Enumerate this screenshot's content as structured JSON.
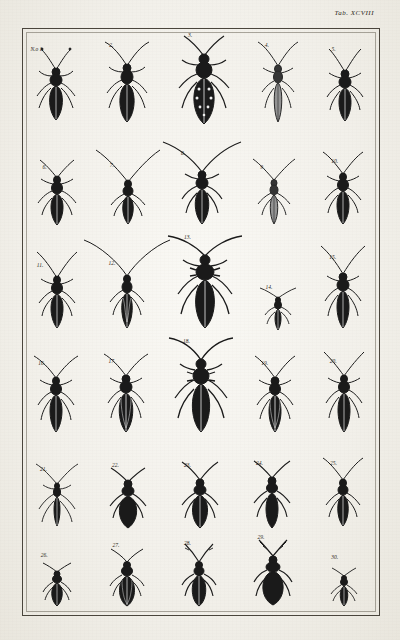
{
  "plate": {
    "tab_label": "Tab. XCVIII",
    "title": "Engraved entomological plate of longhorn beetles (Cerambycidae)",
    "paper_color": "#f3f1ec",
    "ink_color": "#1d1a16",
    "frame_color": "#4a453c"
  },
  "rows": [
    {
      "row_label": "row-1",
      "figures": [
        {
          "number": "N.o 1.",
          "name": "beetle-figure-1",
          "body": "slender",
          "length": 46,
          "antenna": "short-beaded",
          "shade": "dark"
        },
        {
          "number": "2.",
          "name": "beetle-figure-2",
          "body": "slender",
          "length": 48,
          "antenna": "long-curved",
          "shade": "dark"
        },
        {
          "number": "3.",
          "name": "beetle-figure-3",
          "body": "broad-spotted",
          "length": 62,
          "antenna": "very-long-curved",
          "shade": "spotted"
        },
        {
          "number": "4.",
          "name": "beetle-figure-4",
          "body": "narrow-pale",
          "length": 44,
          "antenna": "long-curved",
          "shade": "pale"
        },
        {
          "number": "5.",
          "name": "beetle-figure-5",
          "body": "slender",
          "length": 40,
          "antenna": "short-curved",
          "shade": "dark"
        }
      ]
    },
    {
      "row_label": "row-2",
      "figures": [
        {
          "number": "6.",
          "name": "beetle-figure-6",
          "body": "slender",
          "length": 40,
          "antenna": "medium",
          "shade": "dark"
        },
        {
          "number": "7.",
          "name": "beetle-figure-7",
          "body": "slender",
          "length": 36,
          "antenna": "very-long-sweeping",
          "shade": "dark"
        },
        {
          "number": "8.",
          "name": "beetle-figure-8",
          "body": "slender",
          "length": 44,
          "antenna": "very-long-sweeping",
          "shade": "dark"
        },
        {
          "number": "9.",
          "name": "beetle-figure-9",
          "body": "narrow-pale",
          "length": 36,
          "antenna": "long",
          "shade": "pale"
        },
        {
          "number": "10.",
          "name": "beetle-figure-10",
          "body": "slender",
          "length": 40,
          "antenna": "long-curved",
          "shade": "dark"
        }
      ]
    },
    {
      "row_label": "row-3",
      "figures": [
        {
          "number": "11.",
          "name": "beetle-figure-11",
          "body": "slender",
          "length": 42,
          "antenna": "long-curved",
          "shade": "dark"
        },
        {
          "number": "12.",
          "name": "beetle-figure-12",
          "body": "slender-striped",
          "length": 44,
          "antenna": "very-long-sweeping",
          "shade": "dark"
        },
        {
          "number": "13.",
          "name": "beetle-figure-13",
          "body": "large-spined",
          "length": 66,
          "antenna": "very-long-curved",
          "shade": "dark"
        },
        {
          "number": "14.",
          "name": "beetle-figure-14",
          "body": "small-narrow",
          "length": 26,
          "antenna": "short-spread",
          "shade": "dark"
        },
        {
          "number": "15.",
          "name": "beetle-figure-15",
          "body": "slender",
          "length": 44,
          "antenna": "long-curved",
          "shade": "dark"
        }
      ]
    },
    {
      "row_label": "row-4",
      "figures": [
        {
          "number": "16.",
          "name": "beetle-figure-16",
          "body": "slender",
          "length": 42,
          "antenna": "long-curved",
          "shade": "dark"
        },
        {
          "number": "17.",
          "name": "beetle-figure-17",
          "body": "striped",
          "length": 48,
          "antenna": "long-curved",
          "shade": "striped"
        },
        {
          "number": "18.",
          "name": "beetle-figure-18",
          "body": "large-spined",
          "length": 62,
          "antenna": "very-long-curved",
          "shade": "dark"
        },
        {
          "number": "19.",
          "name": "beetle-figure-19",
          "body": "striped",
          "length": 46,
          "antenna": "long-curved",
          "shade": "striped"
        },
        {
          "number": "20.",
          "name": "beetle-figure-20",
          "body": "slender",
          "length": 44,
          "antenna": "long-curved",
          "shade": "dark"
        }
      ]
    },
    {
      "row_label": "row-5",
      "figures": [
        {
          "number": "21.",
          "name": "beetle-figure-21",
          "body": "thin-long-legs",
          "length": 34,
          "antenna": "long-thin",
          "shade": "dark"
        },
        {
          "number": "22.",
          "name": "beetle-figure-22",
          "body": "broad-oval",
          "length": 44,
          "antenna": "short",
          "shade": "solid-dark"
        },
        {
          "number": "23.",
          "name": "beetle-figure-23",
          "body": "broad",
          "length": 42,
          "antenna": "medium",
          "shade": "dark"
        },
        {
          "number": "24.",
          "name": "beetle-figure-24",
          "body": "elongate-dark",
          "length": 42,
          "antenna": "medium",
          "shade": "solid-dark"
        },
        {
          "number": "25.",
          "name": "beetle-figure-25",
          "body": "slender",
          "length": 38,
          "antenna": "long-curved",
          "shade": "dark"
        }
      ]
    },
    {
      "row_label": "row-6",
      "figures": [
        {
          "number": "26.",
          "name": "beetle-figure-26",
          "body": "small-oval",
          "length": 24,
          "antenna": "short",
          "shade": "dark"
        },
        {
          "number": "27.",
          "name": "beetle-figure-27",
          "body": "oval-striped",
          "length": 34,
          "antenna": "short",
          "shade": "striped"
        },
        {
          "number": "28.",
          "name": "beetle-figure-28",
          "body": "oval-antlered",
          "length": 32,
          "antenna": "branched",
          "shade": "dark"
        },
        {
          "number": "29.",
          "name": "beetle-figure-29",
          "body": "round-broad",
          "length": 34,
          "antenna": "fan-spread",
          "shade": "solid-dark"
        },
        {
          "number": "30.",
          "name": "beetle-figure-30",
          "body": "small-narrow",
          "length": 22,
          "antenna": "short",
          "shade": "dark"
        }
      ]
    }
  ]
}
